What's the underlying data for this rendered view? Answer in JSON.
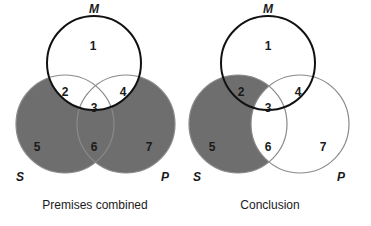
{
  "colors": {
    "shade": "#6e6e6e",
    "m_stroke": "#111111",
    "sp_stroke": "#8a8a8a",
    "background": "#ffffff"
  },
  "diagrams": [
    {
      "caption": "Premises combined",
      "labels": {
        "M": "M",
        "S": "S",
        "P": "P"
      },
      "regions": [
        "1",
        "2",
        "3",
        "4",
        "5",
        "6",
        "7"
      ],
      "shaded_regions": [
        "5",
        "6",
        "7"
      ]
    },
    {
      "caption": "Conclusion",
      "labels": {
        "M": "M",
        "S": "S",
        "P": "P"
      },
      "regions": [
        "1",
        "2",
        "3",
        "4",
        "5",
        "6",
        "7"
      ],
      "shaded_regions": [
        "2",
        "5"
      ]
    }
  ]
}
